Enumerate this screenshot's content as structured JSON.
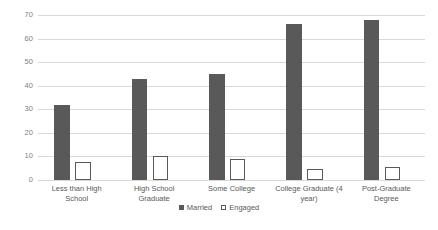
{
  "chart_data": {
    "type": "bar",
    "title": "",
    "xlabel": "",
    "ylabel": "",
    "ylim": [
      0,
      70
    ],
    "yticks": [
      0,
      10,
      20,
      30,
      40,
      50,
      60,
      70
    ],
    "grid": true,
    "legend_position": "bottom",
    "categories": [
      "Less than High School",
      "High School Graduate",
      "Some College",
      "College Graduate (4 year)",
      "Post-Graduate Degree"
    ],
    "series": [
      {
        "name": "Married",
        "values": [
          32,
          43,
          45,
          66,
          68
        ],
        "color": "#595959",
        "style": "filled"
      },
      {
        "name": "Engaged",
        "values": [
          7.5,
          10,
          9,
          4.5,
          5.5
        ],
        "color": "#ffffff",
        "style": "hollow"
      }
    ]
  },
  "legend": {
    "items": [
      {
        "label": "Married",
        "swatch": "filled-square-icon"
      },
      {
        "label": "Engaged",
        "swatch": "hollow-square-icon"
      }
    ]
  },
  "colors": {
    "background": "#ffffff",
    "gridline": "#d9d9d9",
    "series_married": "#595959",
    "series_engaged": "#ffffff",
    "tick_text": "#7f7f7f",
    "label_text": "#595959"
  }
}
